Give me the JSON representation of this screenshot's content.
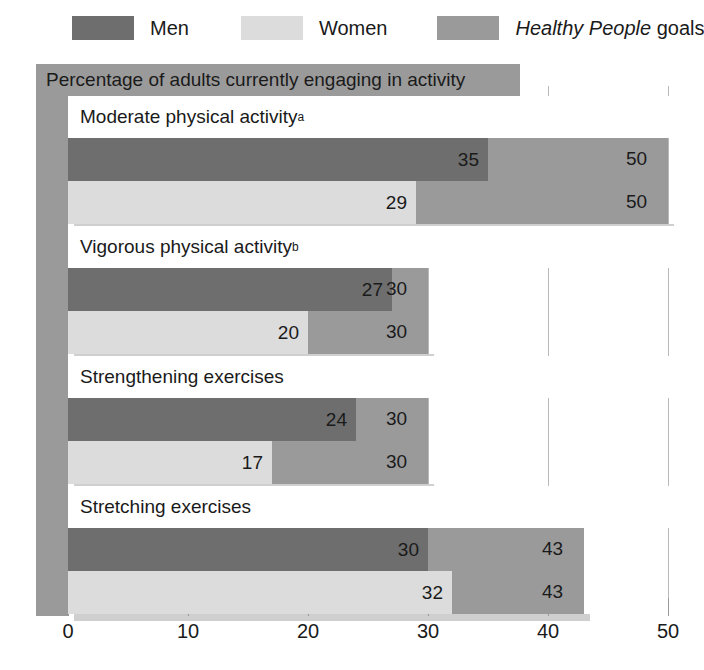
{
  "legend": {
    "items": [
      {
        "key": "men",
        "label": "Men",
        "color": "#6e6e6e"
      },
      {
        "key": "women",
        "label": "Women",
        "color": "#dcdcdc"
      },
      {
        "key": "goals",
        "label_italic": "Healthy People",
        "label_rest": " goals",
        "color": "#9a9a9a"
      }
    ]
  },
  "title": "Percentage of adults currently engaging in activity",
  "axis": {
    "ticks": [
      0,
      10,
      20,
      30,
      40,
      50
    ],
    "tick_labels": [
      "0",
      "10",
      "20",
      "30",
      "40",
      "50"
    ],
    "min": 0,
    "max": 50
  },
  "groups": [
    {
      "label": "Moderate physical activity",
      "footnote": "a",
      "men": 35,
      "women": 29,
      "goal": 50,
      "men_label": "35",
      "women_label": "29",
      "goal_label_men": "50",
      "goal_label_women": "50"
    },
    {
      "label": "Vigorous physical activity",
      "footnote": "b",
      "men": 27,
      "women": 20,
      "goal": 30,
      "men_label": "27",
      "women_label": "20",
      "goal_label_men": "30",
      "goal_label_women": "30"
    },
    {
      "label": "Strengthening exercises",
      "footnote": "",
      "men": 24,
      "women": 17,
      "goal": 30,
      "men_label": "24",
      "women_label": "17",
      "goal_label_men": "30",
      "goal_label_women": "30"
    },
    {
      "label": "Stretching exercises",
      "footnote": "",
      "men": 30,
      "women": 32,
      "goal": 43,
      "men_label": "30",
      "women_label": "32",
      "goal_label_men": "43",
      "goal_label_women": "43"
    }
  ],
  "chart_data": {
    "type": "bar",
    "orientation": "horizontal",
    "title": "Percentage of adults currently engaging in activity",
    "xlabel": "",
    "ylabel": "",
    "xlim": [
      0,
      50
    ],
    "xticks": [
      0,
      10,
      20,
      30,
      40,
      50
    ],
    "grid": true,
    "legend_position": "top",
    "categories": [
      "Moderate physical activity",
      "Vigorous physical activity",
      "Strengthening exercises",
      "Stretching exercises"
    ],
    "series": [
      {
        "name": "Men",
        "values": [
          35,
          29,
          24,
          30
        ],
        "color": "#6e6e6e"
      },
      {
        "name": "Women",
        "values": [
          29,
          20,
          17,
          32
        ],
        "color": "#dcdcdc"
      },
      {
        "name": "Healthy People goals",
        "values": [
          50,
          30,
          30,
          43
        ],
        "color": "#9a9a9a"
      }
    ],
    "annotations": [
      "a - footnote marker on Moderate physical activity",
      "b - footnote marker on Vigorous physical activity"
    ]
  }
}
